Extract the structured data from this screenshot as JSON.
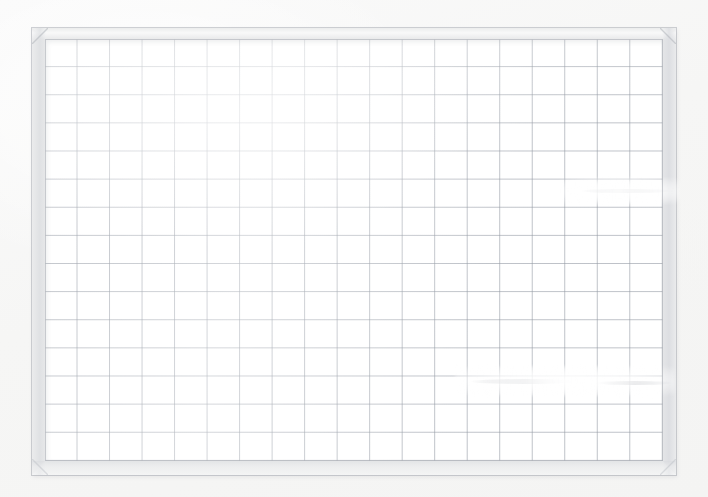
{
  "scene": {
    "title": "Gridded Whiteboard",
    "description": "Empty gridded whiteboard with light aluminium frame",
    "background_color": "#f8f8f7"
  },
  "board": {
    "frame_label": "aluminium-frame",
    "frame_color": "#eceded",
    "frame_edge_color": "#a8acb2",
    "surface_label": "writing-surface",
    "surface_color": "#ffffff",
    "content_text": ""
  },
  "grid": {
    "label": "grid-overlay",
    "line_color": "#969ca6",
    "columns": 19,
    "rows": 15,
    "cell_width_px": 34,
    "cell_height_px": 29
  },
  "marks": [
    {
      "name": "eraser-streak-upper-right",
      "x": 580,
      "y": 189,
      "width": 92,
      "height": 4,
      "kind": "streak"
    },
    {
      "name": "eraser-streak-lower-middle",
      "x": 470,
      "y": 379,
      "width": 110,
      "height": 5,
      "kind": "streak"
    },
    {
      "name": "eraser-streak-lower-right",
      "x": 595,
      "y": 381,
      "width": 78,
      "height": 4,
      "kind": "streak"
    },
    {
      "name": "eraser-wipe-upper-right",
      "x": 560,
      "y": 178,
      "width": 120,
      "height": 26,
      "kind": "wipe"
    },
    {
      "name": "eraser-wipe-lower-right",
      "x": 455,
      "y": 366,
      "width": 220,
      "height": 30,
      "kind": "wipe"
    }
  ]
}
